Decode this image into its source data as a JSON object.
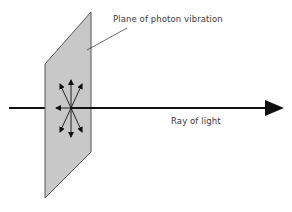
{
  "diagram": {
    "labels": {
      "plane": "Plane of photon vibration",
      "ray": "Ray of light"
    },
    "colors": {
      "plane_fill": "#c8c8c8",
      "plane_stroke": "#555555",
      "ray": "#111111",
      "vector_arrows": "#111111",
      "leader_line": "#444444",
      "text": "#3a3a3a"
    },
    "elements": {
      "plane": {
        "shape": "parallelogram",
        "points": [
          [
            45,
            64
          ],
          [
            91,
            12
          ],
          [
            91,
            152
          ],
          [
            45,
            198
          ]
        ]
      },
      "ray": {
        "from": [
          9,
          108
        ],
        "to": [
          284,
          108
        ],
        "direction": "right"
      },
      "vibration_vectors": {
        "center": [
          71,
          108
        ],
        "count": 7,
        "directions": [
          "up",
          "up-left",
          "up-right",
          "left",
          "down",
          "down-left",
          "down-right"
        ]
      }
    }
  }
}
